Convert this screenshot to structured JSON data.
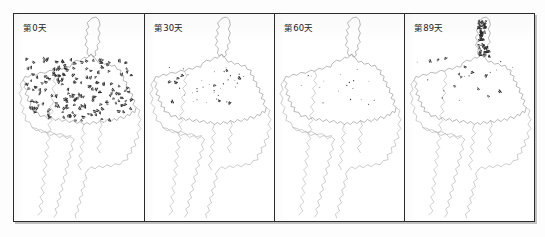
{
  "figure": {
    "type": "multi-panel-map-series",
    "panel_count": 4,
    "frame": {
      "border_color": "#2a2a2a",
      "background": "#ffffff"
    },
    "colors": {
      "coastline": "#8d8d8d",
      "river": "#9d9d9d",
      "marker": "#2b2b2b",
      "label_text": "#1a1a1a",
      "frame": "#2a2a2a",
      "page": "#fdfdfd"
    }
  },
  "panels": [
    {
      "id": "panel-day-0",
      "label": "第0天",
      "day": 0,
      "marker_density": "very-high",
      "marker_count": 184,
      "distribution": "dense coverage across central and western region, extending into southern river basin",
      "seed": 11
    },
    {
      "id": "panel-day-30",
      "label": "第30天",
      "day": 30,
      "marker_density": "low",
      "marker_count": 46,
      "distribution": "sparse scattered points in central band only",
      "seed": 29
    },
    {
      "id": "panel-day-60",
      "label": "第60天",
      "day": 60,
      "marker_density": "very-low",
      "marker_count": 18,
      "distribution": "few isolated points along central axis",
      "seed": 47
    },
    {
      "id": "panel-day-89",
      "label": "第89天",
      "day": 89,
      "marker_density": "clustered",
      "marker_count": 78,
      "distribution": "dense cluster along the northern peninsula, sparse elsewhere in central band",
      "seed": 73
    }
  ],
  "chart_data": {
    "type": "map",
    "title": "",
    "panel_labels": [
      "第0天",
      "第30天",
      "第60天",
      "第89天"
    ],
    "x": [
      0,
      30,
      60,
      89
    ],
    "xlabel": "天",
    "ylabel": "标记点数量",
    "series": [
      {
        "name": "marker_count",
        "values": [
          184,
          46,
          18,
          78
        ]
      }
    ],
    "legend": "none",
    "grid": false
  }
}
